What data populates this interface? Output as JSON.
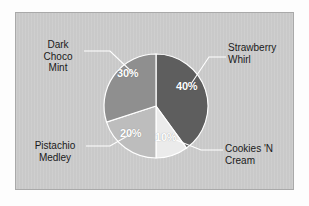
{
  "chart_data": {
    "type": "pie",
    "title": "",
    "categories": [
      "Strawberry Whirl",
      "Cookies 'N Cream",
      "Pistachio Medley",
      "Dark Choco Mint"
    ],
    "values": [
      40,
      10,
      20,
      30
    ],
    "value_labels": [
      "40%",
      "10%",
      "20%",
      "30%"
    ],
    "colors": [
      "#5e5e5e",
      "#ebebeb",
      "#bdbdbd",
      "#8f8f8f"
    ],
    "start_angle_deg": 0,
    "direction": "clockwise",
    "legend": "none",
    "grid": false,
    "label_style": "callout-with-leader-lines",
    "panel_color": "#c9c9c9",
    "slice_border_color": "#ffffff",
    "leader_line_color": "#ffffff",
    "pct_text_color": "#ffffff",
    "category_text_color": "#1a1a1a"
  },
  "slices": [
    {
      "name": "Strawberry Whirl",
      "percent_label": "40%",
      "label_line1": "Strawberry",
      "label_line2": "Whirl"
    },
    {
      "name": "Cookies 'N Cream",
      "percent_label": "10%",
      "label_line1": "Cookies 'N",
      "label_line2": "Cream"
    },
    {
      "name": "Pistachio Medley",
      "percent_label": "20%",
      "label_line1": "Pistachio",
      "label_line2": "Medley"
    },
    {
      "name": "Dark Choco Mint",
      "percent_label": "30%",
      "label_line1": "Dark",
      "label_line2": "Choco",
      "label_line3": "Mint"
    }
  ]
}
